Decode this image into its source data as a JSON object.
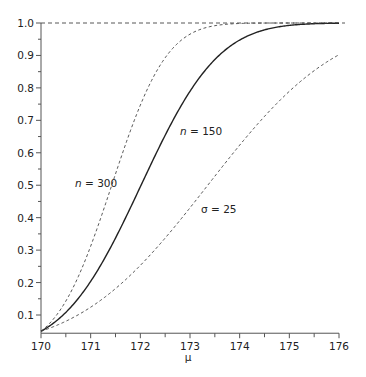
{
  "chart_data": {
    "type": "line",
    "title": "",
    "xlabel": "μ",
    "ylabel": "",
    "xlim": [
      170,
      176
    ],
    "ylim": [
      0.05,
      1.0
    ],
    "grid": false,
    "legend": "none (inline annotations)",
    "x_ticks": [
      "170",
      "171",
      "172",
      "173",
      "174",
      "175",
      "176"
    ],
    "y_ticks": [
      "0.1",
      "0.2",
      "0.3",
      "0.4",
      "0.5",
      "0.6",
      "0.7",
      "0.8",
      "0.9",
      "1.0"
    ],
    "reference_line": {
      "y": 1.0,
      "style": "dashed"
    },
    "x": [
      170.0,
      170.5,
      171.0,
      171.5,
      172.0,
      172.5,
      173.0,
      173.5,
      174.0,
      174.5,
      175.0,
      175.5,
      176.0
    ],
    "series": [
      {
        "name": "n = 150",
        "style": "solid",
        "values": [
          0.05,
          0.12,
          0.23,
          0.38,
          0.55,
          0.71,
          0.84,
          0.92,
          0.97,
          0.99,
          1.0,
          1.0,
          1.0
        ]
      },
      {
        "name": "n = 300",
        "style": "dashed",
        "values": [
          0.05,
          0.17,
          0.38,
          0.63,
          0.83,
          0.94,
          0.99,
          1.0,
          1.0,
          1.0,
          1.0,
          1.0,
          1.0
        ]
      },
      {
        "name": "σ = 25",
        "style": "dashed",
        "values": [
          0.05,
          0.08,
          0.12,
          0.18,
          0.25,
          0.33,
          0.42,
          0.52,
          0.61,
          0.7,
          0.77,
          0.84,
          0.89
        ]
      }
    ],
    "annotations": [
      {
        "text_italic": "n",
        "text": " = 300",
        "near": [
          171.0,
          0.5
        ]
      },
      {
        "text_italic": "n",
        "text": " = 150",
        "near": [
          172.4,
          0.73
        ]
      },
      {
        "text": "σ = 25",
        "near": [
          173.6,
          0.48
        ]
      }
    ]
  },
  "labels": {
    "xlabel": "μ",
    "ann_n300_var": "n",
    "ann_n300_rest": " = 300",
    "ann_n150_var": "n",
    "ann_n150_rest": " = 150",
    "ann_sigma": "σ = 25"
  }
}
